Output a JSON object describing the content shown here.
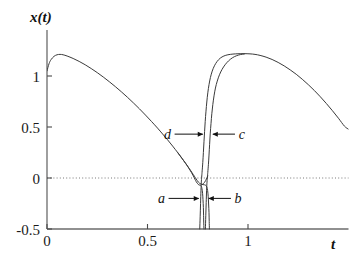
{
  "chart_data": {
    "type": "line",
    "title": "",
    "subtitle": "",
    "xlabel": "t",
    "ylabel": "x(t)",
    "xlim": [
      0,
      1.5
    ],
    "ylim": [
      -0.5,
      1.35
    ],
    "grid": false,
    "legend_position": "inline-annotations",
    "zero_line": {
      "value": 0,
      "style": "dotted"
    },
    "x_ticks": [
      {
        "value": 0,
        "label": "0"
      },
      {
        "value": 0.5,
        "label": "0.5"
      },
      {
        "value": 1,
        "label": "1"
      }
    ],
    "y_ticks": [
      {
        "value": 1,
        "label": "1"
      },
      {
        "value": 0.5,
        "label": "0.5"
      },
      {
        "value": 0,
        "label": "0"
      },
      {
        "value": -0.5,
        "label": "-0.5"
      }
    ],
    "annotations": [
      {
        "id": "d",
        "label": "d",
        "text_x": 0.6,
        "text_y": 0.43,
        "arrow_to_x": 0.775,
        "arrow_to_y": 0.43
      },
      {
        "id": "c",
        "label": "c",
        "text_x": 0.97,
        "text_y": 0.43,
        "arrow_to_x": 0.825,
        "arrow_to_y": 0.43
      },
      {
        "id": "a",
        "label": "a",
        "text_x": 0.57,
        "text_y": -0.2,
        "arrow_to_x": 0.755,
        "arrow_to_y": -0.2
      },
      {
        "id": "b",
        "label": "b",
        "text_x": 0.95,
        "text_y": -0.2,
        "arrow_to_x": 0.805,
        "arrow_to_y": -0.2
      }
    ],
    "series": [
      {
        "name": "branch-a-main",
        "comment": "main descending trajectory from start, crosses zero, plunges down off-axis",
        "points": [
          [
            0.0,
            1.05
          ],
          [
            0.01,
            1.12
          ],
          [
            0.02,
            1.16
          ],
          [
            0.035,
            1.193
          ],
          [
            0.05,
            1.208
          ],
          [
            0.065,
            1.212
          ],
          [
            0.08,
            1.208
          ],
          [
            0.1,
            1.196
          ],
          [
            0.13,
            1.172
          ],
          [
            0.16,
            1.143
          ],
          [
            0.19,
            1.11
          ],
          [
            0.22,
            1.073
          ],
          [
            0.25,
            1.033
          ],
          [
            0.28,
            0.99
          ],
          [
            0.31,
            0.944
          ],
          [
            0.34,
            0.896
          ],
          [
            0.37,
            0.845
          ],
          [
            0.4,
            0.792
          ],
          [
            0.43,
            0.736
          ],
          [
            0.46,
            0.678
          ],
          [
            0.49,
            0.617
          ],
          [
            0.52,
            0.554
          ],
          [
            0.55,
            0.489
          ],
          [
            0.575,
            0.432
          ],
          [
            0.6,
            0.374
          ],
          [
            0.625,
            0.313
          ],
          [
            0.65,
            0.25
          ],
          [
            0.67,
            0.197
          ],
          [
            0.69,
            0.142
          ],
          [
            0.705,
            0.098
          ],
          [
            0.718,
            0.056
          ],
          [
            0.728,
            0.02
          ],
          [
            0.736,
            -0.012
          ],
          [
            0.742,
            -0.035
          ],
          [
            0.748,
            -0.052
          ],
          [
            0.752,
            -0.062
          ],
          [
            0.756,
            -0.068
          ],
          [
            0.76,
            -0.07
          ],
          [
            0.764,
            -0.072
          ],
          [
            0.768,
            -0.082
          ],
          [
            0.771,
            -0.105
          ],
          [
            0.774,
            -0.15
          ],
          [
            0.776,
            -0.21
          ],
          [
            0.778,
            -0.29
          ],
          [
            0.779,
            -0.37
          ],
          [
            0.78,
            -0.45
          ],
          [
            0.781,
            -0.5
          ]
        ]
      },
      {
        "name": "branch-b-main",
        "comment": "second nearly-parallel descending branch, offset slightly right",
        "points": [
          [
            0.65,
            0.25
          ],
          [
            0.68,
            0.17
          ],
          [
            0.7,
            0.115
          ],
          [
            0.715,
            0.072
          ],
          [
            0.728,
            0.033
          ],
          [
            0.738,
            0.003
          ],
          [
            0.746,
            -0.022
          ],
          [
            0.753,
            -0.04
          ],
          [
            0.76,
            -0.053
          ],
          [
            0.768,
            -0.061
          ],
          [
            0.776,
            -0.065
          ],
          [
            0.784,
            -0.067
          ],
          [
            0.79,
            -0.072
          ],
          [
            0.795,
            -0.088
          ],
          [
            0.799,
            -0.122
          ],
          [
            0.802,
            -0.18
          ],
          [
            0.804,
            -0.255
          ],
          [
            0.806,
            -0.34
          ],
          [
            0.807,
            -0.425
          ],
          [
            0.808,
            -0.5
          ]
        ]
      },
      {
        "name": "branch-d-rise",
        "comment": "left steep rising branch from below zero up to second plateau",
        "points": [
          [
            0.76,
            -0.5
          ],
          [
            0.762,
            -0.38
          ],
          [
            0.764,
            -0.25
          ],
          [
            0.766,
            -0.12
          ],
          [
            0.768,
            -0.03
          ],
          [
            0.77,
            0.02
          ],
          [
            0.772,
            0.07
          ],
          [
            0.775,
            0.15
          ],
          [
            0.778,
            0.25
          ],
          [
            0.781,
            0.355
          ],
          [
            0.784,
            0.455
          ],
          [
            0.787,
            0.552
          ],
          [
            0.791,
            0.655
          ],
          [
            0.795,
            0.745
          ],
          [
            0.8,
            0.835
          ],
          [
            0.806,
            0.915
          ],
          [
            0.813,
            0.985
          ],
          [
            0.822,
            1.048
          ],
          [
            0.833,
            1.1
          ],
          [
            0.846,
            1.142
          ],
          [
            0.862,
            1.175
          ],
          [
            0.88,
            1.196
          ],
          [
            0.9,
            1.208
          ],
          [
            0.925,
            1.215
          ],
          [
            0.95,
            1.218
          ],
          [
            0.98,
            1.219
          ],
          [
            1.01,
            1.217
          ],
          [
            1.035,
            1.212
          ],
          [
            1.06,
            1.202
          ],
          [
            1.09,
            1.185
          ],
          [
            1.12,
            1.162
          ],
          [
            1.15,
            1.133
          ],
          [
            1.18,
            1.099
          ],
          [
            1.21,
            1.06
          ],
          [
            1.24,
            1.017
          ],
          [
            1.27,
            0.968
          ],
          [
            1.3,
            0.915
          ],
          [
            1.33,
            0.858
          ],
          [
            1.36,
            0.796
          ],
          [
            1.39,
            0.73
          ],
          [
            1.42,
            0.66
          ],
          [
            1.45,
            0.586
          ],
          [
            1.48,
            0.508
          ],
          [
            1.5,
            0.478
          ]
        ]
      },
      {
        "name": "branch-c-rise",
        "comment": "right steep rising branch, parallel to d, merges at the plateau",
        "points": [
          [
            0.788,
            -0.5
          ],
          [
            0.79,
            -0.37
          ],
          [
            0.792,
            -0.24
          ],
          [
            0.794,
            -0.12
          ],
          [
            0.796,
            -0.04
          ],
          [
            0.798,
            0.01
          ],
          [
            0.8,
            0.055
          ],
          [
            0.803,
            0.13
          ],
          [
            0.806,
            0.225
          ],
          [
            0.809,
            0.33
          ],
          [
            0.812,
            0.432
          ],
          [
            0.816,
            0.535
          ],
          [
            0.82,
            0.63
          ],
          [
            0.825,
            0.72
          ],
          [
            0.831,
            0.805
          ],
          [
            0.838,
            0.882
          ],
          [
            0.847,
            0.95
          ],
          [
            0.858,
            1.012
          ],
          [
            0.871,
            1.065
          ],
          [
            0.886,
            1.11
          ],
          [
            0.903,
            1.148
          ],
          [
            0.922,
            1.178
          ],
          [
            0.942,
            1.198
          ],
          [
            0.962,
            1.21
          ],
          [
            0.982,
            1.216
          ]
        ]
      },
      {
        "name": "branch-b-lower-tail",
        "comment": "short flat segment just under zero connecting into the rise",
        "points": [
          [
            0.77,
            -0.066
          ],
          [
            0.778,
            -0.055
          ],
          [
            0.784,
            -0.042
          ],
          [
            0.789,
            -0.026
          ],
          [
            0.793,
            -0.01
          ],
          [
            0.797,
            0.006
          ],
          [
            0.8,
            0.02
          ]
        ]
      }
    ]
  },
  "axes": {
    "y_axis_name": "x(t)",
    "x_axis_name": "t"
  }
}
